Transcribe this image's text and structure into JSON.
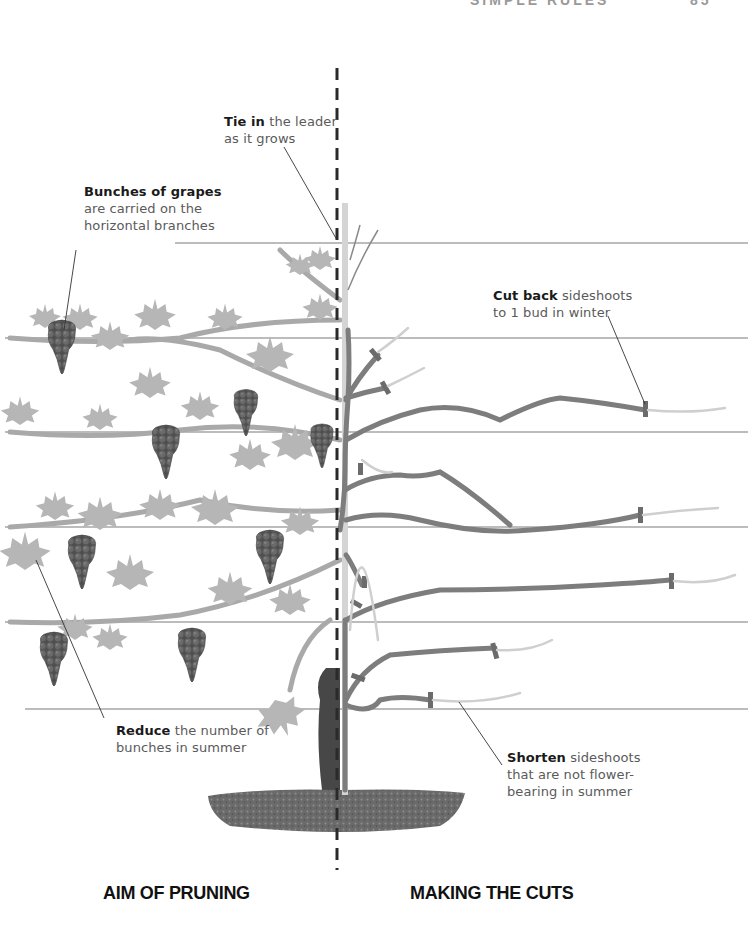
{
  "header": {
    "running_head_fragment": "SIMPLE RULES",
    "page_number_fragment": "85"
  },
  "labels": {
    "tie_in": {
      "bold": "Tie in",
      "rest_line1": " the leader",
      "line2": "as it grows"
    },
    "bunches": {
      "bold": "Bunches of grapes",
      "line2": "are carried on the",
      "line3": "horizontal branches"
    },
    "cut_back": {
      "bold": "Cut back",
      "rest_line1": " sideshoots",
      "line2": "to 1 bud in winter"
    },
    "reduce": {
      "bold": "Reduce",
      "rest_line1": " the number of",
      "line2": "bunches in summer"
    },
    "shorten": {
      "bold": "Shorten",
      "rest_line1": " sideshoots",
      "line2": "that are not flower-",
      "line3": "bearing in summer"
    }
  },
  "sections": {
    "left_title": "AIM OF PRUNING",
    "right_title": "MAKING THE CUTS"
  },
  "colors": {
    "wire": "#7a7a7a",
    "leaf": "#b4b4b4",
    "vine_light": "#a9a9a9",
    "vine_dark": "#7d7d7d",
    "trunk": "#4a4a4a",
    "grape": "#5e5e5e",
    "stake": "#d4d4d4",
    "soil": "#6e6e6e",
    "divider": "#2a2a2a"
  }
}
